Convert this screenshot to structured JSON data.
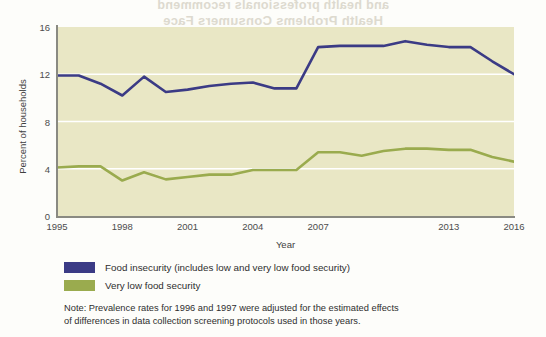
{
  "bleed_through": {
    "line1": "and health professionals recommend",
    "line2": "Health Problems Consumers Face"
  },
  "chart_data": {
    "type": "line",
    "title": "",
    "xlabel": "Year",
    "ylabel": "Percent of households",
    "xlim": [
      1995,
      2016
    ],
    "ylim": [
      0,
      16
    ],
    "grid": "horizontal-white-gridlines",
    "legend_position": "below-plot-left",
    "x": [
      1995,
      1996,
      1997,
      1998,
      1999,
      2000,
      2001,
      2002,
      2003,
      2004,
      2005,
      2006,
      2007,
      2008,
      2009,
      2010,
      2011,
      2012,
      2013,
      2014,
      2015,
      2016
    ],
    "y_ticks": [
      0,
      4,
      8,
      12,
      16
    ],
    "x_ticks": [
      1995,
      1998,
      2001,
      2004,
      2007,
      2013,
      2016
    ],
    "x_tick_labels": [
      "1995",
      "1998",
      "2001",
      "2004",
      "2007",
      "2013",
      "2016"
    ],
    "series": [
      {
        "name": "Food insecurity (includes low and very low food security)",
        "color": "#3b3b85",
        "values": [
          11.9,
          11.9,
          11.2,
          10.2,
          11.8,
          10.5,
          10.7,
          11.0,
          11.2,
          11.3,
          10.8,
          10.8,
          14.3,
          14.4,
          14.4,
          14.4,
          14.8,
          14.5,
          14.3,
          14.3,
          13.1,
          12.0
        ]
      },
      {
        "name": "Very low food security",
        "color": "#9aab4e",
        "values": [
          4.1,
          4.2,
          4.2,
          3.0,
          3.7,
          3.1,
          3.3,
          3.5,
          3.5,
          3.9,
          3.9,
          3.9,
          5.4,
          5.4,
          5.1,
          5.5,
          5.7,
          5.7,
          5.6,
          5.6,
          5.0,
          4.6
        ]
      }
    ],
    "plot_background": "#e9e7c5",
    "gridline_color": "#ffffff"
  },
  "legend": [
    {
      "label": "Food insecurity (includes low and very low food security)",
      "color": "#3b3b85"
    },
    {
      "label": "Very low food security",
      "color": "#9aab4e"
    }
  ],
  "note": {
    "line1": "Note: Prevalence rates for 1996 and 1997 were adjusted for the estimated effects",
    "line2": "of differences in data collection screening protocols used in those years."
  }
}
